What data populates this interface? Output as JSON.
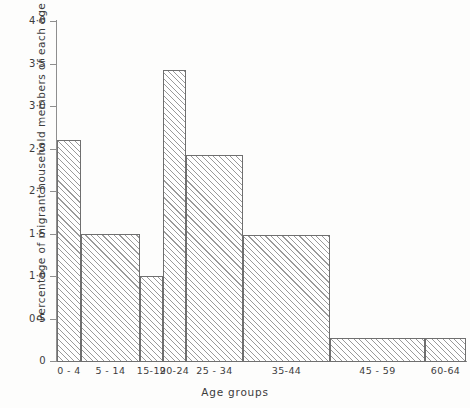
{
  "chart_data": {
    "type": "bar",
    "title": "",
    "subtitle": "",
    "xlabel": "Age groups",
    "ylabel": "Percentage of migrant household members of each age",
    "categories": [
      "0 - 4",
      "5 - 14",
      "15-19",
      "20-24",
      "25 - 34",
      "35-44",
      "45 - 59",
      "60-64"
    ],
    "values": [
      2.6,
      1.5,
      1.0,
      3.42,
      2.42,
      1.48,
      0.27,
      0.27
    ],
    "ylim": [
      0,
      4.0
    ],
    "ytick_values": [
      0,
      0.5,
      1.0,
      1.5,
      2.0,
      2.5,
      3.0,
      3.5,
      4.0
    ],
    "ytick_labels": [
      "0",
      "0·5",
      "1·0",
      "1·5",
      "2·0",
      "2·5",
      "3·0",
      "3·5",
      "4·0"
    ],
    "grid": false,
    "legend": null,
    "annotations": [],
    "bar_widths_note": "variable-width histogram bins matching age-group span",
    "bins": [
      {
        "label": "0 - 4",
        "value": 2.6,
        "x0": 57,
        "x1": 81
      },
      {
        "label": "5 - 14",
        "value": 1.5,
        "x0": 81,
        "x1": 140
      },
      {
        "label": "15-19",
        "value": 1.0,
        "x0": 140,
        "x1": 163
      },
      {
        "label": "20-24",
        "value": 3.42,
        "x0": 163,
        "x1": 186
      },
      {
        "label": "25 - 34",
        "value": 2.42,
        "x0": 186,
        "x1": 243
      },
      {
        "label": "35-44",
        "value": 1.48,
        "x0": 243,
        "x1": 330
      },
      {
        "label": "45 - 59",
        "value": 0.27,
        "x0": 330,
        "x1": 425
      },
      {
        "label": "60-64",
        "value": 0.27,
        "x0": 425,
        "x1": 466
      }
    ],
    "colors": {
      "axis": "#8e8e8e",
      "bar_edge": "#6f6f6f",
      "bar_hatch": "#9a9a9a",
      "bar_fill": "#ffffff",
      "text": "#3c3c3c",
      "background": "#fdfdfc"
    }
  }
}
